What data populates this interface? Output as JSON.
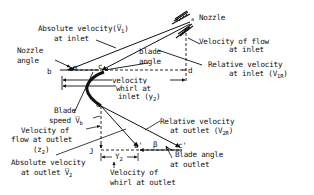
{
  "diagram": {
    "labels": {
      "nozzle": "Nozzle",
      "abs_vel_inlet_1": "Absolute velocity(V̅",
      "abs_vel_inlet_sub": "1",
      "abs_vel_inlet_close": ")",
      "abs_vel_inlet_2": "at inlet",
      "nozzle_angle_1": "Nozzle",
      "nozzle_angle_2": "angle",
      "blade_angle_1": "blade",
      "blade_angle_2": "angle",
      "vel_flow_inlet_1": "Velocity of flow",
      "vel_flow_inlet_2": "at inlet",
      "rel_vel_inlet_1": "Relative velocity",
      "rel_vel_inlet_2": "at inlet (V",
      "rel_vel_inlet_sub": "1R",
      "rel_vel_inlet_close": ")",
      "whirl_inlet_1": "velocity",
      "whirl_inlet_2": "whirl at",
      "whirl_inlet_3": "inlet (y",
      "whirl_inlet_sub": "2",
      "whirl_inlet_close": ")",
      "blade_speed_1": "Blade",
      "blade_speed_2": "speed V̅",
      "blade_speed_sub": "b",
      "vel_flow_outlet_1": "Velocity of",
      "vel_flow_outlet_2": "flow at outlet",
      "vel_flow_outlet_3": "(z",
      "vel_flow_outlet_sub": "2",
      "vel_flow_outlet_close": ")",
      "abs_vel_outlet_1": "Absolute velocity",
      "abs_vel_outlet_2": "at outlet V̅",
      "abs_vel_outlet_sub": "2",
      "rel_vel_outlet_1": "Relative velocity",
      "rel_vel_outlet_2": "at outlet (V",
      "rel_vel_outlet_sub": "2R",
      "rel_vel_outlet_close": ")",
      "blade_angle_outlet_1": "Blade angle",
      "blade_angle_outlet_2": "at outlet",
      "whirl_outlet_1": "Velocity of",
      "whirl_outlet_2": "whirl at outlet",
      "y2_dim": "Y",
      "y2_dim_sub": "2"
    },
    "points": {
      "a": "a",
      "b": "b",
      "c": "c",
      "d": "d",
      "e": "e",
      "J": "J",
      "b_prime": "b'",
      "c_prime": "c'",
      "alpha": "α",
      "beta": "β"
    },
    "colors": {
      "ink": "#111111",
      "background": "#ffffff"
    }
  }
}
